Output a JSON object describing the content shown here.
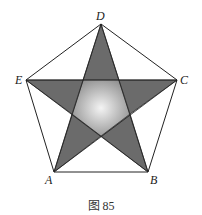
{
  "figure": {
    "caption": "图 85",
    "points": {
      "A": {
        "label": "A",
        "x": 54,
        "y": 172
      },
      "B": {
        "label": "B",
        "x": 148,
        "y": 172
      },
      "C": {
        "label": "C",
        "x": 177,
        "y": 80
      },
      "D": {
        "label": "D",
        "x": 101,
        "y": 24
      },
      "E": {
        "label": "E",
        "x": 26,
        "y": 80
      }
    },
    "colors": {
      "star_fill": "#6b6b6b",
      "center_light": "#f2f2f2",
      "center_dark": "#8a8a8a",
      "stroke": "#222222"
    }
  }
}
